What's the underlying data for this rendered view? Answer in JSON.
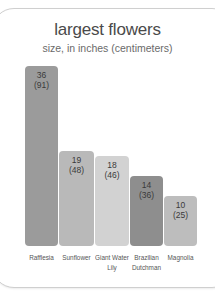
{
  "chart_data": {
    "type": "bar",
    "title": "largest flowers",
    "subtitle": "size, in inches (centimeters)",
    "xlabel": "",
    "ylabel": "",
    "categories": [
      "Rafflesia",
      "Sunflower",
      "Giant Water Lily",
      "Brazilian Dutchman",
      "Magnolia"
    ],
    "values": [
      36,
      19,
      18,
      14,
      10
    ],
    "values_cm": [
      91,
      48,
      46,
      36,
      25
    ],
    "labels": [
      {
        "inches": "36",
        "cm": "(91)"
      },
      {
        "inches": "19",
        "cm": "(48)"
      },
      {
        "inches": "18",
        "cm": "(46)"
      },
      {
        "inches": "14",
        "cm": "(36)"
      },
      {
        "inches": "10",
        "cm": "(25)"
      }
    ],
    "colors": [
      "#9b9b9b",
      "#b9b9b9",
      "#d2d2d2",
      "#8e8e8e",
      "#bdbdbd"
    ],
    "grid": false,
    "legend": "none"
  },
  "xlabels": [
    {
      "line1": "Rafflesia",
      "line2": ""
    },
    {
      "line1": "Sunflower",
      "line2": ""
    },
    {
      "line1": "Giant Water",
      "line2": "Lily"
    },
    {
      "line1": "Brazilian",
      "line2": "Dutchman"
    },
    {
      "line1": "Magnolia",
      "line2": ""
    }
  ]
}
